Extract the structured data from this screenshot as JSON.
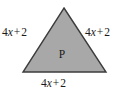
{
  "figure": {
    "type": "equilateral-triangle",
    "shape_label": "P",
    "background_color": "#ffffff",
    "fill_color": "#a8a8a8",
    "stroke_color": "#3c3c3c",
    "text_color": "#1a1a1a",
    "vertices": {
      "apex": [
        64,
        8
      ],
      "bottom_left": [
        23,
        72
      ],
      "bottom_right": [
        106,
        72
      ]
    },
    "side_labels": {
      "left": {
        "coefficient": "4",
        "variable": "x",
        "operator": "+",
        "constant": "2",
        "full": "4x + 2"
      },
      "right": {
        "coefficient": "4",
        "variable": "x",
        "operator": "+",
        "constant": "2",
        "full": "4x + 2"
      },
      "bottom": {
        "coefficient": "4",
        "variable": "x",
        "operator": "+",
        "constant": "2",
        "full": "4x + 2"
      }
    }
  }
}
